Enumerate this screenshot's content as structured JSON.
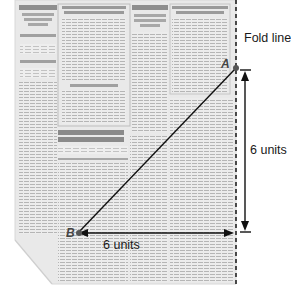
{
  "diagram": {
    "title": "",
    "fold_line": {
      "label": "Fold line",
      "x": 236,
      "style": "dashed"
    },
    "points": [
      {
        "id": "A",
        "label": "A",
        "x": 236,
        "y": 68
      },
      {
        "id": "B",
        "label": "B",
        "x": 78,
        "y": 233
      }
    ],
    "segments": [
      {
        "from": "A",
        "to": "B",
        "type": "line"
      }
    ],
    "dimensions": [
      {
        "id": "horizontal",
        "label": "6 units",
        "orientation": "horizontal",
        "from": [
          78,
          233
        ],
        "to": [
          234,
          233
        ]
      },
      {
        "id": "vertical",
        "label": "6 units",
        "orientation": "vertical",
        "from": [
          245,
          70
        ],
        "to": [
          245,
          232
        ]
      }
    ],
    "background": {
      "type": "newspaper-page",
      "folded_corner": "bottom-left",
      "text_legible": false
    },
    "colors": {
      "line": "#111111",
      "paper": "#ebebeb",
      "print": "#9a9a9a",
      "dashes": "#222222"
    }
  }
}
